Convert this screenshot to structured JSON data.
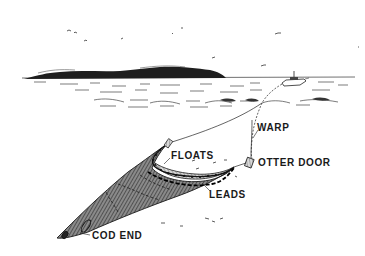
{
  "diagram": {
    "labels": {
      "warp": "WARP",
      "floats": "FLOATS",
      "otter_door": "OTTER DOOR",
      "leads": "LEADS",
      "cod_end": "COD END"
    },
    "elements": [
      {
        "name": "island",
        "description": "distant dark wooded island on horizon"
      },
      {
        "name": "boat",
        "description": "trawler on water surface"
      },
      {
        "name": "waves",
        "description": "sketched water surface ripples"
      },
      {
        "name": "warp-lines",
        "description": "two tow cables from boat to otter doors"
      },
      {
        "name": "otter-doors",
        "description": "two boards spreading the net mouth"
      },
      {
        "name": "trawl-net",
        "description": "cross-hatched funnel-shaped net"
      },
      {
        "name": "float-line",
        "description": "headrope with floats along net mouth top"
      },
      {
        "name": "lead-line",
        "description": "footrope with leads along net mouth bottom"
      },
      {
        "name": "cod-end",
        "description": "closed tail end of net"
      },
      {
        "name": "birds",
        "description": "small gulls in sky"
      }
    ],
    "colors": {
      "ink": "#1a1a1a",
      "background": "#ffffff",
      "net": "#555555"
    }
  }
}
